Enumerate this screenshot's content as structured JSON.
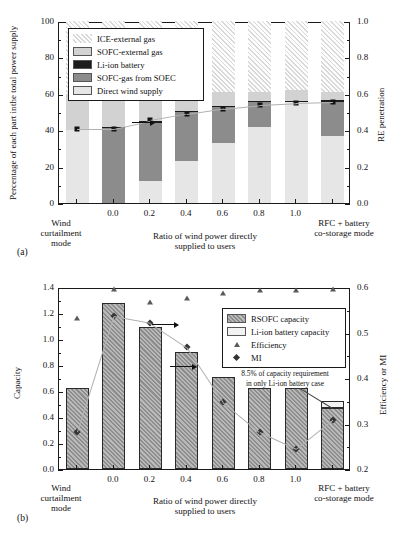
{
  "figure": {
    "panel_a_tag": "(a)",
    "panel_b_tag": "(b)"
  },
  "chart_data": [
    {
      "id": "a",
      "type": "bar",
      "stacked": true,
      "title": "",
      "ylabel": "Percentage of each part in\nthe total power supply",
      "ylabel_right": "RE penetration",
      "xlabel": "Ratio of wind power directly\nsupplied to users",
      "ylim": [
        0,
        100
      ],
      "yticks": [
        "0",
        "20",
        "40",
        "60",
        "80",
        "100"
      ],
      "ylim_right": [
        0.0,
        1.0
      ],
      "yticks_right": [
        "0.0",
        "0.2",
        "0.4",
        "0.6",
        "0.8",
        "1.0"
      ],
      "categories": [
        "Wind\ncurtailment\nmode",
        "0.0",
        "0.2",
        "0.4",
        "0.6",
        "0.8",
        "1.0",
        "RFC + battery\nco-storage mode"
      ],
      "xtick_labels": [
        "0.0",
        "0.2",
        "0.4",
        "0.6",
        "0.8",
        "1.0"
      ],
      "left_group_label": "Wind curtailment mode",
      "right_group_label": "RFC + battery co-storage mode",
      "legend": [
        {
          "label": "ICE-external gas",
          "fill": "hatch-light"
        },
        {
          "label": "SOFC-external gas",
          "fill": "#d2d2d2"
        },
        {
          "label": "Li-ion battery",
          "fill": "#1c1c1c"
        },
        {
          "label": "SOFC-gas from SOEC",
          "fill": "#8c8c8c"
        },
        {
          "label": "Direct wind supply",
          "fill": "#e6e6e6"
        }
      ],
      "series": [
        {
          "name": "Direct wind supply",
          "values": [
            40.0,
            0.0,
            12.0,
            23.0,
            33.0,
            41.5,
            56.0,
            37.0
          ]
        },
        {
          "name": "SOFC-gas from SOEC",
          "values": [
            0.0,
            41.0,
            32.0,
            27.5,
            20.0,
            14.0,
            0.0,
            18.5
          ]
        },
        {
          "name": "Li-ion battery",
          "values": [
            0.0,
            0.5,
            0.8,
            0.3,
            0.3,
            0.3,
            0.3,
            1.2
          ]
        },
        {
          "name": "SOFC-external gas",
          "values": [
            20.0,
            18.5,
            15.2,
            10.2,
            7.7,
            5.2,
            5.7,
            4.3
          ]
        },
        {
          "name": "ICE-external gas",
          "values": [
            40.0,
            40.0,
            40.0,
            39.0,
            39.0,
            39.0,
            38.0,
            39.0
          ]
        }
      ],
      "re_penetration": {
        "name": "RE penetration",
        "marker": "square",
        "values": [
          0.42,
          0.42,
          0.465,
          0.5,
          0.53,
          0.55,
          0.56,
          0.565
        ]
      }
    },
    {
      "id": "b",
      "type": "bar",
      "stacked": true,
      "title": "",
      "ylabel": "Capacity",
      "ylabel_right": "Efficiency or MI",
      "xlabel": "Ratio of wind power directly\nsupplied to users",
      "ylim": [
        0.0,
        1.4
      ],
      "yticks": [
        "0.0",
        "0.2",
        "0.4",
        "0.6",
        "0.8",
        "1.0",
        "1.2",
        "1.4"
      ],
      "ylim_right": [
        0.2,
        0.6
      ],
      "yticks_right": [
        "0.2",
        "0.3",
        "0.4",
        "0.5",
        "0.6"
      ],
      "categories": [
        "Wind\ncurtailment\nmode",
        "0.0",
        "0.2",
        "0.4",
        "0.6",
        "0.8",
        "1.0",
        "RFC + battery\nco-storage mode"
      ],
      "xtick_labels": [
        "0.0",
        "0.2",
        "0.4",
        "0.6",
        "0.8",
        "1.0"
      ],
      "left_group_label": "Wind curtailment mode",
      "right_group_label": "RFC + battery co-storage mode",
      "legend": [
        {
          "label": "RSOFC capacity",
          "fill": "hatch-dark"
        },
        {
          "label": "Li-ion battery capacity",
          "fill": "#f2f2f2"
        },
        {
          "label": "Efficiency",
          "fill": "marker-triangle"
        },
        {
          "label": "MI",
          "fill": "marker-diamond"
        }
      ],
      "series": [
        {
          "name": "RSOFC capacity",
          "values": [
            0.62,
            1.28,
            1.09,
            0.9,
            0.71,
            0.62,
            0.62,
            0.47
          ]
        },
        {
          "name": "Li-ion battery capacity",
          "values": [
            0.0,
            0.0,
            0.0,
            0.0,
            0.0,
            0.0,
            0.0,
            0.053
          ]
        }
      ],
      "efficiency": {
        "name": "Efficiency",
        "marker": "triangle",
        "values": [
          0.537,
          0.6,
          0.572,
          0.581,
          0.592,
          0.597,
          0.598,
          0.6
        ]
      },
      "mi": {
        "name": "MI",
        "marker": "diamond",
        "values": [
          0.286,
          0.54,
          0.525,
          0.472,
          0.351,
          0.285,
          0.248,
          0.312
        ]
      },
      "annotation": {
        "line1": "8.5% of capacity requirement",
        "line2": "in only Li-ion battery case"
      }
    }
  ]
}
